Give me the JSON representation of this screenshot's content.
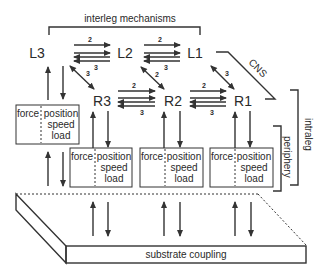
{
  "title_top": "interleg mechanisms",
  "labels": {
    "cns": "CNS",
    "intraleg": "intraleg",
    "periphery": "periphery",
    "substrate": "substrate coupling"
  },
  "nodes": [
    {
      "id": "L3",
      "label": "L3",
      "x": 37,
      "y": 52
    },
    {
      "id": "L2",
      "label": "L2",
      "x": 124,
      "y": 52
    },
    {
      "id": "L1",
      "label": "L1",
      "x": 194,
      "y": 52
    },
    {
      "id": "R3",
      "label": "R3",
      "x": 102,
      "y": 100
    },
    {
      "id": "R2",
      "label": "R2",
      "x": 173,
      "y": 100
    },
    {
      "id": "R1",
      "label": "R1",
      "x": 243,
      "y": 100
    }
  ],
  "horizontal_links": [
    {
      "from": "L3",
      "to": "L2",
      "forward": "2",
      "backward": "3"
    },
    {
      "from": "L2",
      "to": "L1",
      "forward": "2",
      "backward": "3"
    },
    {
      "from": "R3",
      "to": "R2",
      "forward": "2",
      "backward": "3"
    },
    {
      "from": "R2",
      "to": "R1",
      "forward": "2",
      "backward": "3"
    }
  ],
  "diagonal_links": [
    {
      "from": "L3",
      "to": "R3",
      "label": "3"
    },
    {
      "from": "L2",
      "to": "R2",
      "label": "2"
    },
    {
      "from": "L1",
      "to": "R1",
      "label": "3"
    }
  ],
  "sensor_boxes": [
    {
      "leg": "L3",
      "left": "force",
      "right": [
        "position",
        "speed",
        "load"
      ]
    },
    {
      "leg": "R3",
      "left": "force",
      "right": [
        "position",
        "speed",
        "load"
      ]
    },
    {
      "leg": "R2",
      "left": "force",
      "right": [
        "position",
        "speed",
        "load"
      ]
    },
    {
      "leg": "R1",
      "left": "force",
      "right": [
        "position",
        "speed",
        "load"
      ]
    }
  ]
}
